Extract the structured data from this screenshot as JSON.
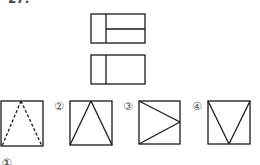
{
  "question": {
    "number_fragment": "27.",
    "footer_fragment": "①"
  },
  "views": [
    {
      "name": "front-view",
      "rect": [
        91,
        14,
        54,
        29
      ],
      "split_x": 106,
      "split_y": 29
    },
    {
      "name": "top-view",
      "rect": [
        91,
        55,
        54,
        29
      ],
      "split_x": 106
    }
  ],
  "options": [
    {
      "label": "",
      "style": "dashed",
      "rect": [
        1,
        101,
        42,
        45
      ],
      "shape": "apex-top"
    },
    {
      "label": "②",
      "style": "solid",
      "rect": [
        70,
        101,
        42,
        44
      ],
      "shape": "apex-top"
    },
    {
      "label": "③",
      "style": "solid",
      "rect": [
        139,
        101,
        41,
        43
      ],
      "shape": "apex-right"
    },
    {
      "label": "④",
      "style": "solid",
      "rect": [
        208,
        101,
        42,
        43
      ],
      "shape": "apex-bottom"
    }
  ],
  "colors": {
    "line": "#1a1a1a",
    "label": "#555555"
  }
}
